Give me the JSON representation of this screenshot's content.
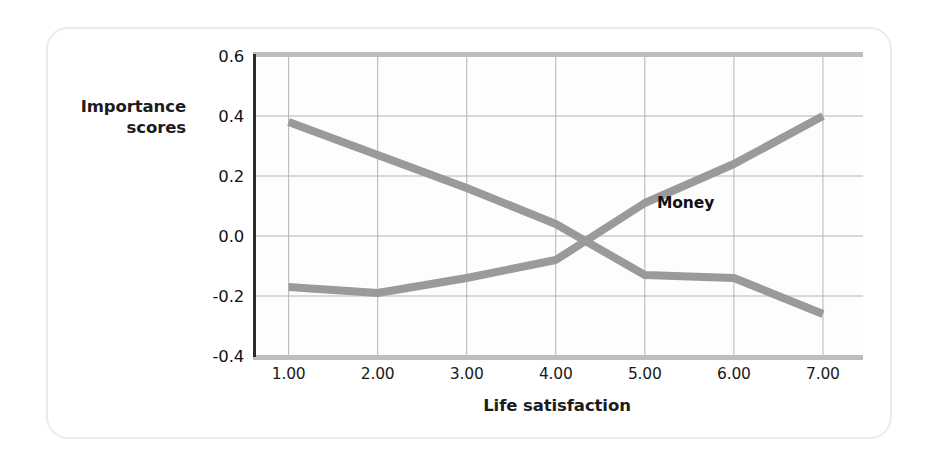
{
  "figure": {
    "y_axis_title_line1": "Importance",
    "y_axis_title_line2": "scores",
    "x_axis_title": "Life satisfaction",
    "line_color": "#9a9a9a",
    "grid_color": "#b4b4b4",
    "axis_color": "#2b2b2b",
    "frame_color": "#ebebeb",
    "plot_background": "#fdfdfd"
  },
  "chart_data": {
    "type": "line",
    "title": "",
    "xlabel": "Life satisfaction",
    "ylabel": "Importance scores",
    "xlim": [
      0.6,
      7.45
    ],
    "ylim": [
      -0.4,
      0.6
    ],
    "xticks": [
      1,
      2,
      3,
      4,
      5,
      6,
      7
    ],
    "xtick_labels": [
      "1.00",
      "2.00",
      "3.00",
      "4.00",
      "5.00",
      "6.00",
      "7.00"
    ],
    "yticks": [
      -0.4,
      -0.2,
      0.0,
      0.2,
      0.4,
      0.6
    ],
    "ytick_labels": [
      "-0.4",
      "-0.2",
      "0.0",
      "0.2",
      "0.4",
      "0.6"
    ],
    "grid": true,
    "legend": "inline-labels",
    "x": [
      1,
      2,
      3,
      4,
      5,
      6,
      7
    ],
    "series": [
      {
        "name": "Money",
        "label": "Money",
        "color": "#9a9a9a",
        "values": [
          0.38,
          0.27,
          0.16,
          0.04,
          -0.13,
          -0.14,
          -0.26
        ]
      },
      {
        "name": "Love",
        "label": "Love",
        "color": "#9a9a9a",
        "values": [
          -0.17,
          -0.19,
          -0.14,
          -0.08,
          0.11,
          0.24,
          0.4
        ]
      }
    ]
  }
}
